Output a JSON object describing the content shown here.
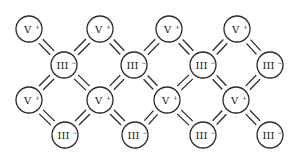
{
  "diagram": {
    "title": "",
    "type": "ionic-crystal-lattice",
    "colors": {
      "stroke": "#2a2a2a",
      "background": "#ffffff",
      "text": "#1a1a1a"
    },
    "atom_radius": 13,
    "bond_gap": 2.8,
    "atoms": [
      {
        "id": "a1",
        "symbol": "V",
        "charge": "+",
        "x": 29,
        "y": 29
      },
      {
        "id": "a2",
        "symbol": "V",
        "charge": "+",
        "x": 100,
        "y": 29
      },
      {
        "id": "a3",
        "symbol": "V",
        "charge": "+",
        "x": 169,
        "y": 29
      },
      {
        "id": "a4",
        "symbol": "V",
        "charge": "+",
        "x": 237,
        "y": 29
      },
      {
        "id": "b1",
        "symbol": "III",
        "charge": "−",
        "x": 64,
        "y": 65
      },
      {
        "id": "b2",
        "symbol": "III",
        "charge": "−",
        "x": 134,
        "y": 65
      },
      {
        "id": "b3",
        "symbol": "III",
        "charge": "−",
        "x": 203,
        "y": 65
      },
      {
        "id": "b4",
        "symbol": "III",
        "charge": "−",
        "x": 270,
        "y": 65
      },
      {
        "id": "c1",
        "symbol": "V",
        "charge": "+",
        "x": 29,
        "y": 100
      },
      {
        "id": "c2",
        "symbol": "V",
        "charge": "+",
        "x": 100,
        "y": 100
      },
      {
        "id": "c3",
        "symbol": "V",
        "charge": "+",
        "x": 167,
        "y": 100
      },
      {
        "id": "c4",
        "symbol": "V",
        "charge": "+",
        "x": 236,
        "y": 100
      },
      {
        "id": "d1",
        "symbol": "III",
        "charge": "−",
        "x": 65,
        "y": 135
      },
      {
        "id": "d2",
        "symbol": "III",
        "charge": "−",
        "x": 135,
        "y": 135
      },
      {
        "id": "d3",
        "symbol": "III",
        "charge": "−",
        "x": 203,
        "y": 135
      },
      {
        "id": "d4",
        "symbol": "III",
        "charge": "−",
        "x": 270,
        "y": 135
      }
    ],
    "bonds": [
      [
        "a1",
        "b1"
      ],
      [
        "a2",
        "b1"
      ],
      [
        "a2",
        "b2"
      ],
      [
        "a3",
        "b2"
      ],
      [
        "a3",
        "b3"
      ],
      [
        "a4",
        "b3"
      ],
      [
        "a4",
        "b4"
      ],
      [
        "c1",
        "b1"
      ],
      [
        "c2",
        "b1"
      ],
      [
        "c2",
        "b2"
      ],
      [
        "c3",
        "b2"
      ],
      [
        "c3",
        "b3"
      ],
      [
        "c4",
        "b3"
      ],
      [
        "c4",
        "b4"
      ],
      [
        "c1",
        "d1"
      ],
      [
        "c2",
        "d1"
      ],
      [
        "c2",
        "d2"
      ],
      [
        "c3",
        "d2"
      ],
      [
        "c3",
        "d3"
      ],
      [
        "c4",
        "d3"
      ],
      [
        "c4",
        "d4"
      ]
    ]
  }
}
